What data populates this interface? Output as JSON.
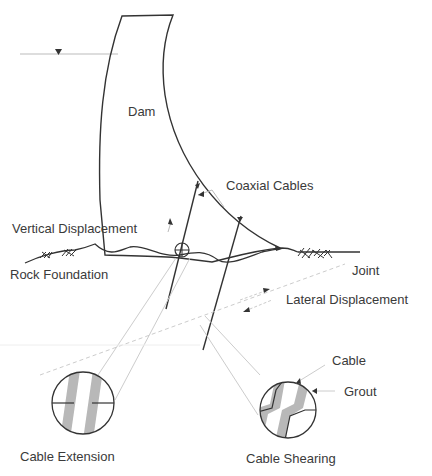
{
  "diagram": {
    "labels": {
      "dam": "Dam",
      "coaxial_cables": "Coaxial Cables",
      "vertical_displacement": "Vertical Displacement",
      "rock_foundation": "Rock Foundation",
      "joint": "Joint",
      "lateral_displacement": "Lateral Displacement",
      "cable": "Cable",
      "grout": "Grout",
      "cable_extension": "Cable Extension",
      "cable_shearing": "Cable Shearing"
    },
    "colors": {
      "line": "#333333",
      "light_line": "#bbbbbb",
      "grout_fill": "#b8b8b8",
      "text": "#3a3a3a"
    }
  }
}
